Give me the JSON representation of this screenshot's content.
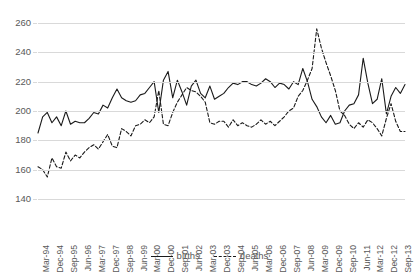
{
  "chart_data": {
    "type": "line",
    "title": "",
    "subtitle": "",
    "xlabel": "",
    "ylabel": "",
    "ylim": [
      140,
      260
    ],
    "ytick_labels": [
      "260",
      "240",
      "220",
      "200",
      "180",
      "160",
      "140"
    ],
    "ytick_values": [
      260,
      240,
      220,
      200,
      180,
      160,
      140
    ],
    "grid": true,
    "legend_position": "bottom-center",
    "x_tick_labels": [
      "Mar-94",
      "Dec-94",
      "Sep-95",
      "Jun-96",
      "Mar-97",
      "Dec-97",
      "Sep-98",
      "Jun-99",
      "Mar-00",
      "Dec-00",
      "Sep-01",
      "Jun-02",
      "Mar-03",
      "Dec-03",
      "Sep-04",
      "Jun-05",
      "Mar-06",
      "Dec-06",
      "Sep-07",
      "Jun-08",
      "Mar-09",
      "Dec-09",
      "Sep-10",
      "Jun-11",
      "Mar-12",
      "Dec-12",
      "Sep-13"
    ],
    "x_tick_step_quarters": 3,
    "x": [
      "Mar-94",
      "Jun-94",
      "Sep-94",
      "Dec-94",
      "Mar-95",
      "Jun-95",
      "Sep-95",
      "Dec-95",
      "Mar-96",
      "Jun-96",
      "Sep-96",
      "Dec-96",
      "Mar-97",
      "Jun-97",
      "Sep-97",
      "Dec-97",
      "Mar-98",
      "Jun-98",
      "Sep-98",
      "Dec-98",
      "Mar-99",
      "Jun-99",
      "Sep-99",
      "Dec-99",
      "Mar-00",
      "Jun-00",
      "Sep-00",
      "Dec-00",
      "Mar-01",
      "Jun-01",
      "Sep-01",
      "Dec-01",
      "Mar-02",
      "Jun-02",
      "Sep-02",
      "Dec-02",
      "Mar-03",
      "Jun-03",
      "Sep-03",
      "Dec-03",
      "Mar-04",
      "Jun-04",
      "Sep-04",
      "Dec-04",
      "Mar-05",
      "Jun-05",
      "Sep-05",
      "Dec-05",
      "Mar-06",
      "Jun-06",
      "Sep-06",
      "Dec-06",
      "Mar-07",
      "Jun-07",
      "Sep-07",
      "Dec-07",
      "Mar-08",
      "Jun-08",
      "Sep-08",
      "Dec-08",
      "Mar-09",
      "Jun-09",
      "Sep-09",
      "Dec-09",
      "Mar-10",
      "Jun-10",
      "Sep-10",
      "Dec-10",
      "Mar-11",
      "Jun-11",
      "Sep-11",
      "Dec-11",
      "Mar-12",
      "Jun-12",
      "Sep-12",
      "Dec-12",
      "Mar-13",
      "Jun-13",
      "Sep-13",
      "Dec-13"
    ],
    "series": [
      {
        "name": "births",
        "style": "solid",
        "color": "#1a1a1a",
        "values": [
          185,
          196,
          199,
          192,
          196,
          190,
          200,
          191,
          193,
          192,
          192,
          195,
          199,
          198,
          204,
          202,
          209,
          215,
          209,
          207,
          206,
          207,
          211,
          212,
          216,
          220,
          199,
          221,
          227,
          209,
          221,
          213,
          204,
          217,
          221,
          212,
          209,
          217,
          208,
          210,
          212,
          216,
          219,
          218,
          220,
          220,
          218,
          217,
          219,
          222,
          220,
          216,
          219,
          218,
          215,
          220,
          218,
          229,
          220,
          208,
          203,
          196,
          192,
          197,
          191,
          192,
          200,
          204,
          205,
          211,
          236,
          219,
          205,
          208,
          222,
          198,
          210,
          216,
          212,
          218
        ]
      },
      {
        "name": "deaths",
        "style": "dashed",
        "color": "#1a1a1a",
        "values": [
          162,
          160,
          155,
          168,
          162,
          161,
          172,
          166,
          170,
          168,
          172,
          175,
          177,
          174,
          179,
          184,
          176,
          175,
          188,
          186,
          183,
          190,
          191,
          194,
          192,
          196,
          214,
          191,
          190,
          199,
          206,
          211,
          216,
          214,
          213,
          210,
          206,
          192,
          191,
          193,
          193,
          189,
          194,
          190,
          192,
          190,
          189,
          191,
          194,
          191,
          193,
          190,
          193,
          196,
          200,
          202,
          210,
          214,
          221,
          229,
          256,
          243,
          233,
          224,
          214,
          200,
          197,
          191,
          188,
          192,
          189,
          194,
          192,
          188,
          183,
          195,
          205,
          193,
          186,
          186
        ]
      }
    ]
  },
  "legend": {
    "entries": [
      {
        "label": "births",
        "style": "solid"
      },
      {
        "label": "deaths",
        "style": "dashed"
      }
    ]
  }
}
